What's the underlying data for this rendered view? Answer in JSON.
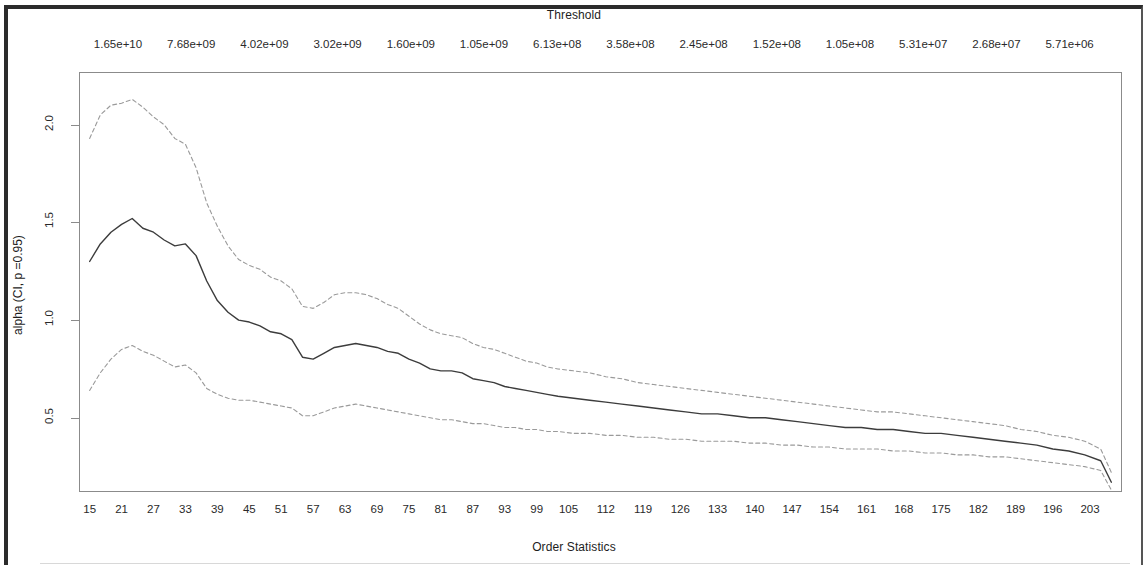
{
  "figure": {
    "top_axis_title": "Threshold",
    "bottom_axis_title": "Order Statistics",
    "y_axis_title": "alpha (CI, p =0.95)"
  },
  "chart_data": {
    "type": "line",
    "title": "Threshold",
    "xlabel": "Order Statistics",
    "ylabel": "alpha (CI, p =0.95)",
    "grid": false,
    "legend": "none",
    "xlim": [
      13,
      209
    ],
    "ylim": [
      0.12,
      2.27
    ],
    "x_tick_labels": [
      "15",
      "21",
      "27",
      "33",
      "39",
      "45",
      "51",
      "57",
      "63",
      "69",
      "75",
      "81",
      "87",
      "93",
      "99",
      "105",
      "112",
      "119",
      "126",
      "133",
      "140",
      "147",
      "154",
      "161",
      "168",
      "175",
      "182",
      "189",
      "196",
      "203"
    ],
    "top_axis_tick_labels": [
      "1.65e+10",
      "7.68e+09",
      "4.02e+09",
      "3.02e+09",
      "1.60e+09",
      "1.05e+09",
      "6.13e+08",
      "3.58e+08",
      "2.45e+08",
      "1.52e+08",
      "1.05e+08",
      "5.31e+07",
      "2.68e+07",
      "5.71e+06"
    ],
    "y_tick_labels": [
      "0.5",
      "1.0",
      "1.5",
      "2.0"
    ],
    "y_tick_values": [
      0.5,
      1.0,
      1.5,
      2.0
    ],
    "series": [
      {
        "name": "alpha estimate",
        "style": "solid",
        "color": "#3c3c3c",
        "x": [
          15,
          17,
          19,
          21,
          23,
          25,
          27,
          29,
          31,
          33,
          35,
          37,
          39,
          41,
          43,
          45,
          47,
          49,
          51,
          53,
          55,
          57,
          59,
          61,
          63,
          65,
          67,
          69,
          71,
          73,
          75,
          77,
          79,
          81,
          83,
          85,
          87,
          89,
          91,
          93,
          95,
          97,
          99,
          101,
          103,
          106,
          109,
          112,
          115,
          118,
          121,
          124,
          127,
          130,
          133,
          136,
          139,
          142,
          145,
          148,
          151,
          154,
          157,
          160,
          163,
          166,
          169,
          172,
          175,
          178,
          181,
          184,
          187,
          190,
          193,
          196,
          199,
          202,
          205,
          207
        ],
        "values": [
          1.3,
          1.39,
          1.45,
          1.49,
          1.52,
          1.47,
          1.45,
          1.41,
          1.38,
          1.39,
          1.33,
          1.2,
          1.1,
          1.04,
          1.0,
          0.99,
          0.97,
          0.94,
          0.93,
          0.9,
          0.81,
          0.8,
          0.83,
          0.86,
          0.87,
          0.88,
          0.87,
          0.86,
          0.84,
          0.83,
          0.8,
          0.78,
          0.75,
          0.74,
          0.74,
          0.73,
          0.7,
          0.69,
          0.68,
          0.66,
          0.65,
          0.64,
          0.63,
          0.62,
          0.61,
          0.6,
          0.59,
          0.58,
          0.57,
          0.56,
          0.55,
          0.54,
          0.53,
          0.52,
          0.52,
          0.51,
          0.5,
          0.5,
          0.49,
          0.48,
          0.47,
          0.46,
          0.45,
          0.45,
          0.44,
          0.44,
          0.43,
          0.42,
          0.42,
          0.41,
          0.4,
          0.39,
          0.38,
          0.37,
          0.36,
          0.34,
          0.33,
          0.31,
          0.28,
          0.17
        ]
      },
      {
        "name": "upper confidence limit",
        "style": "dashed",
        "color": "#9a9a9a",
        "x": [
          15,
          17,
          19,
          21,
          23,
          25,
          27,
          29,
          31,
          33,
          35,
          37,
          39,
          41,
          43,
          45,
          47,
          49,
          51,
          53,
          55,
          57,
          59,
          61,
          63,
          65,
          67,
          69,
          71,
          73,
          75,
          77,
          79,
          81,
          83,
          85,
          87,
          89,
          91,
          93,
          95,
          97,
          99,
          101,
          103,
          106,
          109,
          112,
          115,
          118,
          121,
          124,
          127,
          130,
          133,
          136,
          139,
          142,
          145,
          148,
          151,
          154,
          157,
          160,
          163,
          166,
          169,
          172,
          175,
          178,
          181,
          184,
          187,
          190,
          193,
          196,
          199,
          202,
          205,
          207
        ],
        "values": [
          1.93,
          2.05,
          2.1,
          2.11,
          2.13,
          2.09,
          2.04,
          2.0,
          1.93,
          1.9,
          1.78,
          1.6,
          1.48,
          1.38,
          1.31,
          1.28,
          1.26,
          1.22,
          1.2,
          1.16,
          1.07,
          1.06,
          1.09,
          1.13,
          1.14,
          1.14,
          1.13,
          1.11,
          1.08,
          1.06,
          1.02,
          0.98,
          0.95,
          0.93,
          0.92,
          0.91,
          0.88,
          0.86,
          0.85,
          0.83,
          0.81,
          0.79,
          0.78,
          0.76,
          0.75,
          0.74,
          0.73,
          0.71,
          0.7,
          0.68,
          0.67,
          0.66,
          0.65,
          0.64,
          0.63,
          0.62,
          0.61,
          0.6,
          0.59,
          0.58,
          0.57,
          0.56,
          0.55,
          0.54,
          0.53,
          0.53,
          0.52,
          0.51,
          0.5,
          0.49,
          0.48,
          0.47,
          0.46,
          0.44,
          0.43,
          0.41,
          0.4,
          0.38,
          0.34,
          0.22
        ]
      },
      {
        "name": "lower confidence limit",
        "style": "dashed",
        "color": "#9a9a9a",
        "x": [
          15,
          17,
          19,
          21,
          23,
          25,
          27,
          29,
          31,
          33,
          35,
          37,
          39,
          41,
          43,
          45,
          47,
          49,
          51,
          53,
          55,
          57,
          59,
          61,
          63,
          65,
          67,
          69,
          71,
          73,
          75,
          77,
          79,
          81,
          83,
          85,
          87,
          89,
          91,
          93,
          95,
          97,
          99,
          101,
          103,
          106,
          109,
          112,
          115,
          118,
          121,
          124,
          127,
          130,
          133,
          136,
          139,
          142,
          145,
          148,
          151,
          154,
          157,
          160,
          163,
          166,
          169,
          172,
          175,
          178,
          181,
          184,
          187,
          190,
          193,
          196,
          199,
          202,
          205,
          207
        ],
        "values": [
          0.64,
          0.73,
          0.8,
          0.85,
          0.87,
          0.84,
          0.82,
          0.79,
          0.76,
          0.77,
          0.73,
          0.65,
          0.62,
          0.6,
          0.59,
          0.59,
          0.58,
          0.57,
          0.56,
          0.55,
          0.51,
          0.51,
          0.53,
          0.55,
          0.56,
          0.57,
          0.56,
          0.55,
          0.54,
          0.53,
          0.52,
          0.51,
          0.5,
          0.49,
          0.49,
          0.48,
          0.47,
          0.47,
          0.46,
          0.45,
          0.45,
          0.44,
          0.44,
          0.43,
          0.43,
          0.42,
          0.42,
          0.41,
          0.41,
          0.4,
          0.4,
          0.39,
          0.39,
          0.38,
          0.38,
          0.38,
          0.37,
          0.37,
          0.36,
          0.36,
          0.35,
          0.35,
          0.34,
          0.34,
          0.34,
          0.33,
          0.33,
          0.32,
          0.32,
          0.31,
          0.31,
          0.3,
          0.3,
          0.29,
          0.28,
          0.27,
          0.26,
          0.25,
          0.23,
          0.13
        ]
      }
    ]
  }
}
